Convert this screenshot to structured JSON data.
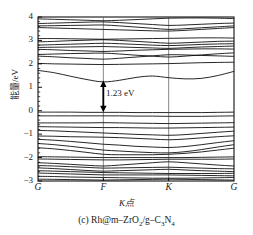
{
  "figure": {
    "caption": "(c) Rh@m–ZrO₂/g–C₃N₄",
    "caption_label": "(c)",
    "caption_material": "Rh@m–ZrO₂/g–C₃N₄",
    "gap_annotation": "1.23 eV"
  },
  "chart_data": {
    "type": "line",
    "subtitle": "",
    "xlabel": "K点",
    "ylabel": "能量/eV",
    "grid": true,
    "legend": null,
    "ylim": [
      -3,
      4
    ],
    "xlim": [
      0,
      3
    ],
    "yticks": [
      -3,
      -2,
      -1,
      0,
      1,
      2,
      3,
      4
    ],
    "ytick_labels": [
      "−3",
      "−2",
      "−1",
      "0",
      "1",
      "2",
      "3",
      "4"
    ],
    "minor_yticks_per_interval": 4,
    "xticks": [
      0,
      1,
      2,
      3
    ],
    "xtick_labels": [
      "G",
      "F",
      "K",
      "G"
    ],
    "high_symmetry_lines": [
      1,
      2
    ],
    "annotations": [
      {
        "text": "1.23 eV",
        "type": "double-arrow",
        "x": 1.0,
        "y_from": 0.0,
        "y_to": 1.23,
        "value": 1.23,
        "units": "eV",
        "meaning": "band gap"
      }
    ],
    "band_gap_eV": 1.23,
    "valence_band_maximum_eV": 0.0,
    "conduction_band_minimum_eV": 1.23,
    "x_samples": [
      0,
      0.25,
      0.5,
      0.75,
      1,
      1.25,
      1.5,
      1.75,
      2,
      2.25,
      2.5,
      2.75,
      3
    ],
    "bands": [
      {
        "name": "c12",
        "values": [
          3.92,
          3.9,
          3.88,
          3.86,
          3.84,
          3.86,
          3.89,
          3.92,
          3.95,
          3.96,
          3.96,
          3.95,
          3.93
        ]
      },
      {
        "name": "c11",
        "values": [
          3.72,
          3.74,
          3.76,
          3.78,
          3.79,
          3.76,
          3.72,
          3.68,
          3.64,
          3.66,
          3.69,
          3.72,
          3.74
        ]
      },
      {
        "name": "c10",
        "values": [
          3.62,
          3.63,
          3.64,
          3.65,
          3.66,
          3.62,
          3.57,
          3.52,
          3.47,
          3.5,
          3.54,
          3.58,
          3.62
        ]
      },
      {
        "name": "c9",
        "values": [
          3.55,
          3.53,
          3.51,
          3.49,
          3.47,
          3.45,
          3.43,
          3.41,
          3.4,
          3.43,
          3.47,
          3.51,
          3.55
        ]
      },
      {
        "name": "c8",
        "values": [
          3.08,
          3.08,
          3.07,
          3.06,
          3.05,
          3.06,
          3.07,
          3.08,
          3.09,
          3.1,
          3.11,
          3.11,
          3.1
        ]
      },
      {
        "name": "c7",
        "values": [
          2.94,
          2.96,
          2.99,
          3.01,
          3.03,
          3.0,
          2.96,
          2.92,
          2.88,
          2.9,
          2.93,
          2.96,
          2.97
        ]
      },
      {
        "name": "c6",
        "values": [
          2.8,
          2.82,
          2.84,
          2.86,
          2.88,
          2.86,
          2.83,
          2.8,
          2.78,
          2.8,
          2.83,
          2.85,
          2.86
        ]
      },
      {
        "name": "c5",
        "values": [
          2.7,
          2.71,
          2.72,
          2.73,
          2.74,
          2.72,
          2.7,
          2.68,
          2.66,
          2.69,
          2.72,
          2.74,
          2.76
        ]
      },
      {
        "name": "c4",
        "values": [
          2.62,
          2.6,
          2.57,
          2.55,
          2.53,
          2.55,
          2.58,
          2.6,
          2.62,
          2.63,
          2.64,
          2.64,
          2.63
        ]
      },
      {
        "name": "c3",
        "values": [
          2.4,
          2.42,
          2.44,
          2.45,
          2.46,
          2.42,
          2.37,
          2.33,
          2.29,
          2.33,
          2.38,
          2.43,
          2.47
        ]
      },
      {
        "name": "c2",
        "values": [
          2.33,
          2.3,
          2.26,
          2.23,
          2.2,
          2.24,
          2.29,
          2.34,
          2.39,
          2.38,
          2.36,
          2.34,
          2.32
        ]
      },
      {
        "name": "c1",
        "values": [
          2.02,
          2.0,
          1.99,
          1.98,
          1.97,
          1.98,
          1.99,
          2.0,
          2.01,
          2.03,
          2.05,
          2.06,
          2.07
        ]
      },
      {
        "name": "cbm",
        "values": [
          1.72,
          1.62,
          1.47,
          1.33,
          1.23,
          1.3,
          1.42,
          1.48,
          1.41,
          1.36,
          1.38,
          1.5,
          1.68
        ]
      },
      {
        "name": "vbm",
        "values": [
          -0.06,
          -0.06,
          -0.06,
          -0.07,
          -0.07,
          -0.07,
          -0.08,
          -0.08,
          -0.08,
          -0.08,
          -0.08,
          -0.07,
          -0.06
        ]
      },
      {
        "name": "v2",
        "values": [
          -0.22,
          -0.22,
          -0.22,
          -0.22,
          -0.22,
          -0.22,
          -0.23,
          -0.23,
          -0.24,
          -0.24,
          -0.24,
          -0.23,
          -0.22
        ]
      },
      {
        "name": "v3",
        "values": [
          -0.52,
          -0.52,
          -0.52,
          -0.52,
          -0.51,
          -0.52,
          -0.53,
          -0.54,
          -0.55,
          -0.54,
          -0.53,
          -0.52,
          -0.51
        ]
      },
      {
        "name": "v4",
        "values": [
          -0.68,
          -0.69,
          -0.7,
          -0.71,
          -0.72,
          -0.72,
          -0.73,
          -0.74,
          -0.74,
          -0.73,
          -0.72,
          -0.71,
          -0.7
        ]
      },
      {
        "name": "v5",
        "values": [
          -0.84,
          -0.86,
          -0.89,
          -0.92,
          -0.95,
          -0.98,
          -1.01,
          -1.03,
          -1.05,
          -1.02,
          -0.97,
          -0.92,
          -0.87
        ]
      },
      {
        "name": "v6",
        "values": [
          -1.08,
          -1.09,
          -1.11,
          -1.12,
          -1.13,
          -1.15,
          -1.18,
          -1.21,
          -1.24,
          -1.21,
          -1.16,
          -1.11,
          -1.07
        ]
      },
      {
        "name": "v7",
        "values": [
          -1.22,
          -1.26,
          -1.31,
          -1.37,
          -1.43,
          -1.47,
          -1.52,
          -1.55,
          -1.57,
          -1.53,
          -1.45,
          -1.36,
          -1.28
        ]
      },
      {
        "name": "v8",
        "values": [
          -1.4,
          -1.45,
          -1.52,
          -1.6,
          -1.68,
          -1.72,
          -1.76,
          -1.79,
          -1.8,
          -1.75,
          -1.66,
          -1.55,
          -1.45
        ]
      },
      {
        "name": "v9",
        "values": [
          -1.58,
          -1.63,
          -1.7,
          -1.78,
          -1.86,
          -1.88,
          -1.88,
          -1.88,
          -1.86,
          -1.82,
          -1.76,
          -1.68,
          -1.6
        ]
      },
      {
        "name": "v10",
        "values": [
          -1.96,
          -1.97,
          -1.98,
          -1.99,
          -2.0,
          -2.0,
          -2.0,
          -2.0,
          -2.0,
          -2.0,
          -1.99,
          -1.98,
          -1.97
        ]
      },
      {
        "name": "v11",
        "values": [
          -2.06,
          -2.07,
          -2.08,
          -2.09,
          -2.1,
          -2.1,
          -2.09,
          -2.08,
          -2.07,
          -2.07,
          -2.07,
          -2.07,
          -2.06
        ]
      },
      {
        "name": "v12",
        "values": [
          -2.22,
          -2.25,
          -2.29,
          -2.33,
          -2.36,
          -2.32,
          -2.27,
          -2.22,
          -2.18,
          -2.22,
          -2.27,
          -2.32,
          -2.36
        ]
      },
      {
        "name": "v13",
        "values": [
          -2.34,
          -2.36,
          -2.39,
          -2.42,
          -2.45,
          -2.44,
          -2.43,
          -2.42,
          -2.41,
          -2.43,
          -2.45,
          -2.47,
          -2.48
        ]
      },
      {
        "name": "v14",
        "values": [
          -2.44,
          -2.47,
          -2.51,
          -2.55,
          -2.58,
          -2.56,
          -2.54,
          -2.52,
          -2.5,
          -2.53,
          -2.56,
          -2.58,
          -2.6
        ]
      },
      {
        "name": "v15",
        "values": [
          -2.56,
          -2.58,
          -2.6,
          -2.62,
          -2.64,
          -2.65,
          -2.66,
          -2.67,
          -2.68,
          -2.68,
          -2.68,
          -2.68,
          -2.67
        ]
      },
      {
        "name": "v16",
        "values": [
          -2.66,
          -2.68,
          -2.7,
          -2.72,
          -2.74,
          -2.74,
          -2.74,
          -2.74,
          -2.74,
          -2.75,
          -2.76,
          -2.77,
          -2.78
        ]
      },
      {
        "name": "v17",
        "values": [
          -2.8,
          -2.81,
          -2.83,
          -2.84,
          -2.85,
          -2.86,
          -2.87,
          -2.88,
          -2.88,
          -2.88,
          -2.87,
          -2.86,
          -2.85
        ]
      },
      {
        "name": "v18",
        "values": [
          -2.92,
          -2.93,
          -2.94,
          -2.95,
          -2.96,
          -2.95,
          -2.94,
          -2.93,
          -2.92,
          -2.93,
          -2.94,
          -2.95,
          -2.96
        ]
      }
    ]
  },
  "axes": {
    "ylabel": "能量/eV",
    "xlabel": "K点",
    "ytick_labels": [
      "4",
      "3",
      "2",
      "1",
      "0",
      "−1",
      "−2",
      "−3"
    ],
    "xtick_labels": [
      "G",
      "F",
      "K",
      "G"
    ]
  }
}
